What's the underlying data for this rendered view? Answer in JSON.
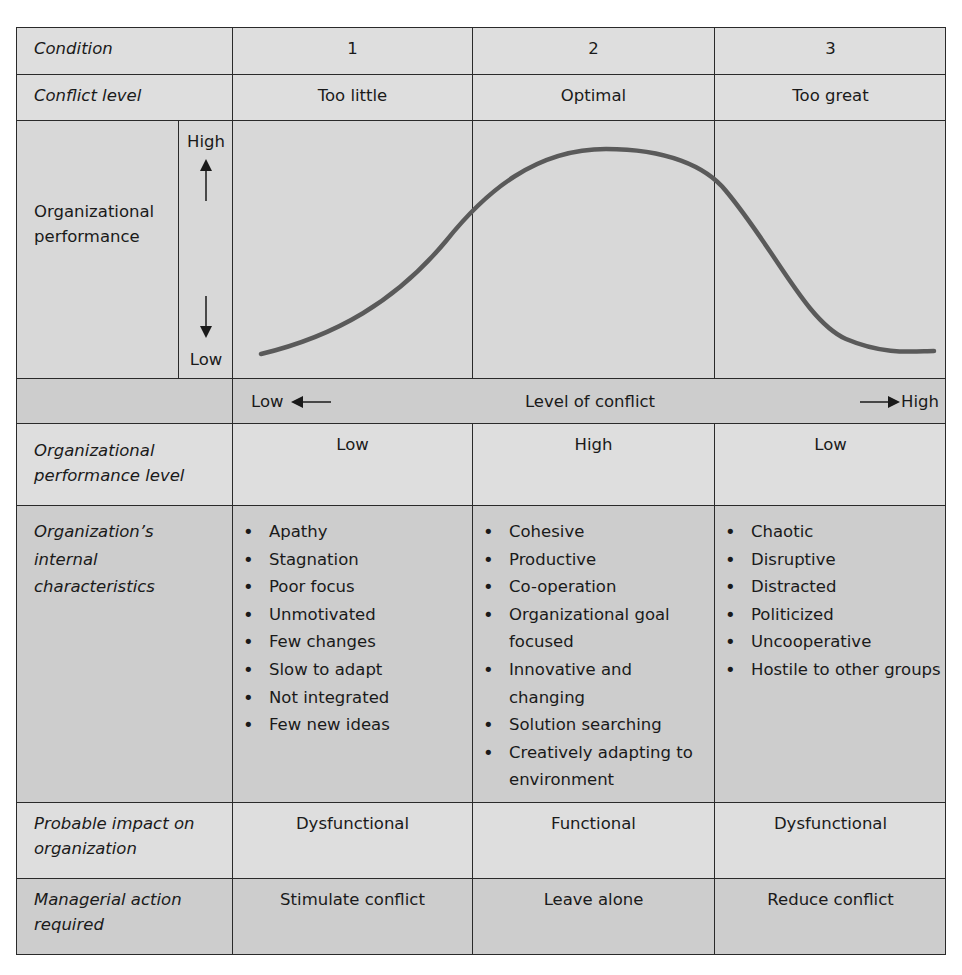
{
  "table": {
    "rows": {
      "condition": {
        "label": "Condition",
        "values": [
          "1",
          "2",
          "3"
        ]
      },
      "conflict_level": {
        "label": "Conflict level",
        "values": [
          "Too little",
          "Optimal",
          "Too great"
        ]
      },
      "performance_chart": {
        "y_label": "Organizational performance",
        "y_high": "High",
        "y_low": "Low"
      },
      "conflict_axis": {
        "low": "Low",
        "title": "Level of conflict",
        "high": "High"
      },
      "performance_level": {
        "label": "Organizational performance level",
        "values": [
          "Low",
          "High",
          "Low"
        ]
      },
      "internal_characteristics": {
        "label": "Organization’s internal characteristics",
        "col1": [
          "Apathy",
          "Stagnation",
          "Poor focus",
          "Unmotivated",
          "Few changes",
          "Slow to adapt",
          "Not integrated",
          "Few new ideas"
        ],
        "col2": [
          "Cohesive",
          "Productive",
          "Co-operation",
          "Organizational goal focused",
          "Innovative and changing",
          "Solution searching",
          "Creatively adapting to environment"
        ],
        "col3": [
          "Chaotic",
          "Disruptive",
          "Distracted",
          "Politicized",
          "Uncooperative",
          "Hostile to other groups"
        ]
      },
      "probable_impact": {
        "label": "Probable impact on organization",
        "values": [
          "Dysfunctional",
          "Functional",
          "Dysfunctional"
        ]
      },
      "managerial_action": {
        "label": "Managerial action required",
        "values": [
          "Stimulate conflict",
          "Leave alone",
          "Reduce conflict"
        ]
      }
    }
  },
  "colors": {
    "light_row": "#dedede",
    "dark_row": "#cdcdcd",
    "grid_line": "#2a2a2a",
    "curve": "#5a5a5a"
  }
}
